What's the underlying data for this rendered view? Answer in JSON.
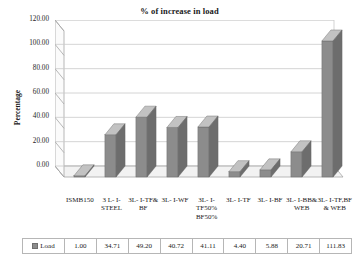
{
  "chart_data": {
    "type": "bar",
    "title": "% of increase in load",
    "xlabel": "",
    "ylabel": "Percentage",
    "ylim": [
      0,
      120
    ],
    "ytick_step": 20,
    "grid": true,
    "legend_position": "bottom-table",
    "series_name": "Load",
    "categories": [
      "ISMB150",
      "3 L- I-STEEL",
      "3L- I-TF&BF",
      "3L- I-WF",
      "3L- I-TF50% BF50%",
      "3L- I-TF",
      "3L- I-BF",
      "3L- I-BB& WEB",
      "3L- I-TF,BF & WEB"
    ],
    "category_lines": [
      [
        "ISMB150"
      ],
      [
        "3 L- I-",
        "STEEL"
      ],
      [
        "3L- I-TF&",
        "BF"
      ],
      [
        "3L- I-WF"
      ],
      [
        "3L- I-",
        "TF50%",
        "BF50%"
      ],
      [
        "3L- I-TF"
      ],
      [
        "3L- I-BF"
      ],
      [
        "3L- I-BB&",
        "WEB"
      ],
      [
        "3L- I-TF,BF",
        "& WEB"
      ]
    ],
    "values": [
      1.0,
      34.71,
      49.2,
      40.72,
      41.11,
      4.4,
      5.88,
      20.71,
      111.83
    ],
    "value_labels": [
      "1.00",
      "34.71",
      "49.20",
      "40.72",
      "41.11",
      "4.40",
      "5.88",
      "20.71",
      "111.83"
    ],
    "ytick_labels": [
      "0.00",
      "20.00",
      "40.00",
      "60.00",
      "80.00",
      "100.00",
      "120.00"
    ],
    "colors": {
      "bar_front": "#8c8c8c",
      "bar_top": "#c2c2c2",
      "bar_side": "#6d6d6d",
      "grid": "#c9c9c9",
      "axis": "#a6a6a6",
      "floor": "#f2f2f2",
      "text": "#1a1a1a"
    }
  },
  "data_table": {
    "legend_label": "Load"
  }
}
